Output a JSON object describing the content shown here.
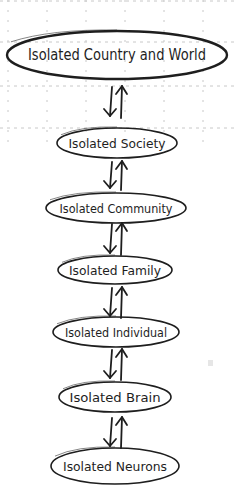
{
  "diagram": {
    "type": "hierarchy-flow",
    "direction": "vertical",
    "nodes": [
      {
        "id": "country",
        "label": "Isolated Country and World",
        "cx": 117,
        "cy": 55,
        "rx": 110,
        "ry": 24,
        "font": 15
      },
      {
        "id": "society",
        "label": "Isolated Society",
        "cx": 117,
        "cy": 143,
        "rx": 60,
        "ry": 15,
        "font": 13
      },
      {
        "id": "community",
        "label": "Isolated Community",
        "cx": 116,
        "cy": 208,
        "rx": 70,
        "ry": 15,
        "font": 13
      },
      {
        "id": "family",
        "label": "Isolated Family",
        "cx": 115,
        "cy": 270,
        "rx": 57,
        "ry": 14,
        "font": 13
      },
      {
        "id": "individual",
        "label": "Isolated Individual",
        "cx": 116,
        "cy": 332,
        "rx": 63,
        "ry": 15,
        "font": 13
      },
      {
        "id": "brain",
        "label": "Isolated Brain",
        "cx": 115,
        "cy": 397,
        "rx": 56,
        "ry": 15,
        "font": 13
      },
      {
        "id": "neurons",
        "label": "Isolated Neurons",
        "cx": 115,
        "cy": 466,
        "rx": 64,
        "ry": 18,
        "font": 13
      }
    ],
    "connectors": [
      {
        "from": "country",
        "to": "society",
        "y1": 87,
        "y2": 116,
        "symbol": "bidirectional-arrows"
      },
      {
        "from": "society",
        "to": "community",
        "y1": 162,
        "y2": 188,
        "symbol": "bidirectional-arrows"
      },
      {
        "from": "community",
        "to": "family",
        "y1": 224,
        "y2": 253,
        "symbol": "bidirectional-arrows"
      },
      {
        "from": "family",
        "to": "individual",
        "y1": 288,
        "y2": 316,
        "symbol": "bidirectional-arrows"
      },
      {
        "from": "individual",
        "to": "brain",
        "y1": 350,
        "y2": 378,
        "symbol": "bidirectional-arrows"
      },
      {
        "from": "brain",
        "to": "neurons",
        "y1": 418,
        "y2": 446,
        "symbol": "bidirectional-arrows"
      }
    ],
    "colors": {
      "stroke": "#1e1e1e",
      "grid": "#c8c8c8",
      "background": "#ffffff"
    }
  }
}
